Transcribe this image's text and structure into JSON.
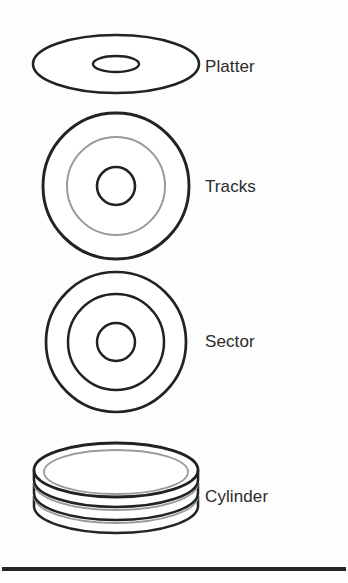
{
  "figure": {
    "background_color": "#fdfdfd",
    "stroke_color_dark": "#222222",
    "stroke_color_light": "#9a9a9a",
    "label_color": "#2b2b2b"
  },
  "labels": {
    "platter": "Platter",
    "tracks": "Tracks",
    "sector": "Sector",
    "cylinder": "Cylinder"
  },
  "shapes": {
    "platter": {
      "name": "platter-ellipse",
      "center": [
        116,
        64
      ],
      "outer_rx": 83,
      "outer_ry": 29,
      "hole_rx": 23,
      "hole_ry": 8
    },
    "tracks": {
      "name": "tracks-circles",
      "center": [
        116,
        186
      ],
      "radii": [
        73,
        49,
        19
      ],
      "ring_styles": [
        "dark",
        "light",
        "dark"
      ]
    },
    "sector": {
      "name": "sector-circles",
      "center": [
        116,
        342
      ],
      "radii": [
        70,
        48,
        19
      ],
      "ring_styles": [
        "dark",
        "dark",
        "dark"
      ]
    },
    "cylinder": {
      "name": "cylinder-stack",
      "center": [
        116,
        470
      ],
      "rx": 82,
      "ry": 27,
      "stack_height": 38,
      "layers": 3
    }
  },
  "rule": {
    "name": "bottom-rule",
    "y": 569,
    "x_start": 2,
    "x_end": 346,
    "thickness": 4
  }
}
